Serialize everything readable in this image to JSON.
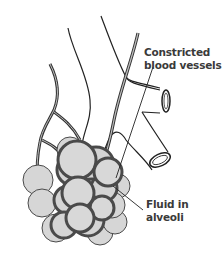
{
  "diagram": {
    "labels": {
      "constricted_vessels": [
        "Constricted",
        "blood vessels"
      ],
      "fluid": [
        "Fluid in",
        "alveoli"
      ]
    },
    "colors": {
      "alveolus_fill": "#d4d4d4",
      "alveolus_stroke": "#4a4a4a",
      "line": "#222222",
      "text": "#3a3a3a",
      "background": "#ffffff"
    }
  }
}
